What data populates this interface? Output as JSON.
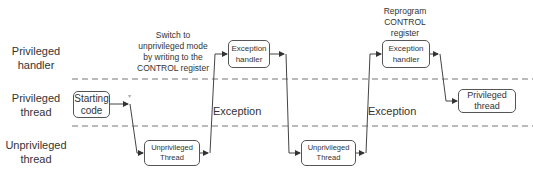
{
  "lanes": [
    {
      "id": "privileged-handler",
      "label_line1": "Privileged",
      "label_line2": "handler"
    },
    {
      "id": "privileged-thread",
      "label_line1": "Privileged",
      "label_line2": "thread"
    },
    {
      "id": "unprivileged-thread",
      "label_line1": "Unprivileged",
      "label_line2": "thread"
    }
  ],
  "notes": {
    "switch": [
      "Switch to",
      "unprivileged mode",
      "by writing to the",
      "CONTROL register"
    ],
    "reprogram": [
      "Reprogram",
      "CONTROL",
      "register"
    ]
  },
  "boxes": {
    "starting_code": [
      "Starting",
      "code"
    ],
    "unpriv_thread_1": [
      "Unprivileged",
      "Thread"
    ],
    "exception_handler_1": [
      "Exception",
      "handler"
    ],
    "unpriv_thread_2": [
      "Unprivileged",
      "Thread"
    ],
    "exception_handler_2": [
      "Exception",
      "handler"
    ],
    "privileged_thread": [
      "Privileged",
      "thread"
    ]
  },
  "edge_labels": {
    "exception_1": "Exception",
    "exception_2": "Exception"
  },
  "colors": {
    "line": "#444444",
    "dash": "#777777",
    "box_border": "#555555"
  }
}
